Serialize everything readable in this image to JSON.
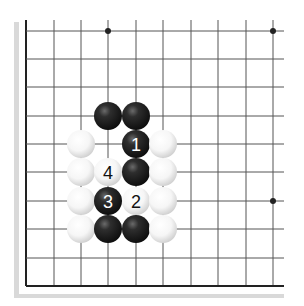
{
  "diagram": {
    "type": "go-board-fragment",
    "colors": {
      "background": "#ffffff",
      "grid_line": "#555555",
      "edge_line": "#222222",
      "shadow": "#d9d9d9",
      "star_point": "#222222",
      "black_stone": "#1a1a1a",
      "white_stone": "#f4f4f4"
    },
    "grid": {
      "columns": 10,
      "rows": 10,
      "x": [
        26,
        54,
        81,
        108,
        136,
        163,
        191,
        218,
        246,
        273
      ],
      "y": [
        31,
        59,
        87,
        116,
        144,
        172,
        201,
        229,
        258,
        286
      ],
      "open_top": true,
      "open_right": true,
      "edge_left": true,
      "edge_bottom": true
    },
    "star_points": [
      {
        "col": 3,
        "row": 0
      },
      {
        "col": 9,
        "row": 0
      },
      {
        "col": 9,
        "row": 6
      }
    ],
    "stones": [
      {
        "color": "black",
        "col": 3,
        "row": 3,
        "label": ""
      },
      {
        "color": "black",
        "col": 4,
        "row": 3,
        "label": ""
      },
      {
        "color": "white",
        "col": 2,
        "row": 4,
        "label": ""
      },
      {
        "color": "black",
        "col": 4,
        "row": 4,
        "label": "1"
      },
      {
        "color": "white",
        "col": 5,
        "row": 4,
        "label": ""
      },
      {
        "color": "white",
        "col": 2,
        "row": 5,
        "label": ""
      },
      {
        "color": "white",
        "col": 3,
        "row": 5,
        "label": "4"
      },
      {
        "color": "black",
        "col": 4,
        "row": 5,
        "label": ""
      },
      {
        "color": "white",
        "col": 5,
        "row": 5,
        "label": ""
      },
      {
        "color": "white",
        "col": 2,
        "row": 6,
        "label": ""
      },
      {
        "color": "black",
        "col": 3,
        "row": 6,
        "label": "3"
      },
      {
        "color": "white",
        "col": 4,
        "row": 6,
        "label": "2"
      },
      {
        "color": "white",
        "col": 5,
        "row": 6,
        "label": ""
      },
      {
        "color": "white",
        "col": 2,
        "row": 7,
        "label": ""
      },
      {
        "color": "black",
        "col": 3,
        "row": 7,
        "label": ""
      },
      {
        "color": "black",
        "col": 4,
        "row": 7,
        "label": ""
      },
      {
        "color": "white",
        "col": 5,
        "row": 7,
        "label": ""
      }
    ],
    "move_labels": [
      "1",
      "2",
      "3",
      "4"
    ]
  }
}
